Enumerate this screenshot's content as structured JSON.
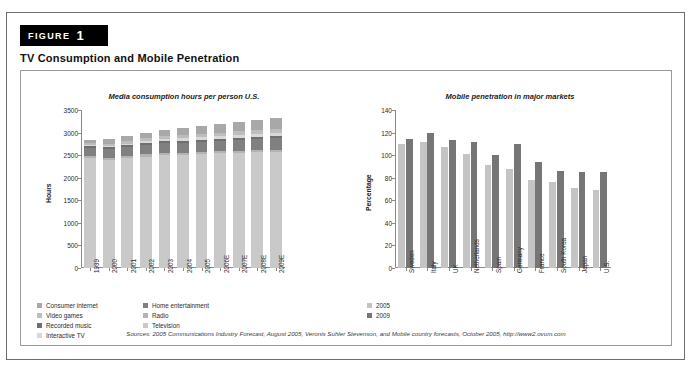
{
  "figure": {
    "tag_word": "FIGURE",
    "tag_number": "1",
    "title": "TV Consumption and Mobile Penetration",
    "source": "Sources: 2005 Communications Industry Forecast, August 2005, Veronis Suhler Stevenson, and Mobile country forecasts, October 2005, http://www2.ovum.com"
  },
  "colors": {
    "television": "#c9c9c9",
    "radio": "#b3b3b3",
    "home_entertainment": "#808080",
    "interactive_tv": "#d8d8d8",
    "recorded_music": "#6f6f6f",
    "video_games": "#bdbdbd",
    "consumer_internet": "#a8a8a8",
    "year_2005": "#c4c4c4",
    "year_2009": "#767676",
    "axis": "#8a8a8a",
    "frame": "#9a9a9a",
    "tag_bg": "#000000"
  },
  "chart_data": [
    {
      "type": "bar",
      "id": "media-consumption",
      "title": "Media consumption hours per person U.S.",
      "xlabel": "",
      "ylabel": "Hours",
      "ylim": [
        0,
        3500
      ],
      "yticks": [
        0,
        500,
        1000,
        1500,
        2000,
        2500,
        3000,
        3500
      ],
      "grid": false,
      "stacked": true,
      "legend_position": "below",
      "categories": [
        "1999",
        "2000",
        "2001",
        "2002",
        "2003",
        "2004",
        "2005",
        "2006E",
        "2007E",
        "2008E",
        "2009E"
      ],
      "series": [
        {
          "name": "Television",
          "values": [
            2430,
            2400,
            2440,
            2470,
            2500,
            2510,
            2525,
            2540,
            2555,
            2570,
            2580
          ]
        },
        {
          "name": "Radio",
          "values": [
            45,
            45,
            45,
            45,
            45,
            45,
            45,
            45,
            45,
            45,
            45
          ]
        },
        {
          "name": "Home entertainment",
          "values": [
            180,
            195,
            200,
            215,
            220,
            225,
            230,
            235,
            240,
            245,
            250
          ]
        },
        {
          "name": "Recorded music",
          "values": [
            40,
            40,
            40,
            40,
            40,
            40,
            40,
            40,
            40,
            40,
            40
          ]
        },
        {
          "name": "Interactive TV",
          "values": [
            20,
            25,
            30,
            40,
            45,
            50,
            55,
            60,
            65,
            70,
            75
          ]
        },
        {
          "name": "Video games",
          "values": [
            45,
            50,
            55,
            60,
            65,
            70,
            75,
            80,
            90,
            95,
            100
          ]
        },
        {
          "name": "Consumer internet",
          "values": [
            80,
            100,
            110,
            130,
            150,
            160,
            175,
            190,
            200,
            215,
            225
          ]
        }
      ],
      "legend_left": [
        "Consumer internet",
        "Video games",
        "Recorded music",
        "Interactive TV"
      ],
      "legend_right": [
        "Home entertainment",
        "Radio",
        "Television"
      ]
    },
    {
      "type": "bar",
      "id": "mobile-penetration",
      "title": "Mobile penetration in major markets",
      "xlabel": "",
      "ylabel": "Percentage",
      "ylim": [
        0,
        140
      ],
      "yticks": [
        0,
        20,
        40,
        60,
        80,
        100,
        120,
        140
      ],
      "grid": false,
      "stacked": false,
      "legend_position": "below",
      "categories": [
        "Sweden",
        "Italy",
        "UK",
        "Netherlands",
        "Spain",
        "Germany",
        "France",
        "South Korea",
        "Japan",
        "U.S."
      ],
      "series": [
        {
          "name": "2005",
          "values": [
            110,
            112,
            107,
            101,
            91,
            88,
            78,
            76,
            71,
            69
          ]
        },
        {
          "name": "2009",
          "values": [
            114,
            120,
            113,
            112,
            100,
            110,
            94,
            86,
            85,
            85
          ]
        }
      ]
    }
  ]
}
